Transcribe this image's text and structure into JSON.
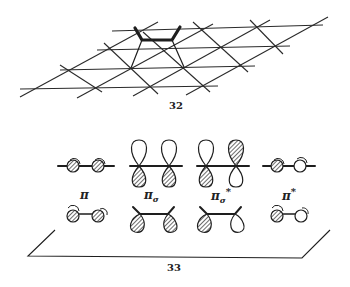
{
  "figures": [
    {
      "number": "32",
      "description": "Ethylene-like molecule adsorbed on a surface lattice (grid) with bonds to two surface atoms"
    },
    {
      "number": "33",
      "description": "Frontier orbitals of ethylene above and interacting with a surface plane",
      "orbitals": [
        {
          "symbol": "π",
          "subscript": "",
          "superscript": "",
          "name": "pi"
        },
        {
          "symbol": "π",
          "subscript": "σ",
          "superscript": "",
          "name": "pi-sigma"
        },
        {
          "symbol": "π",
          "subscript": "σ",
          "superscript": "*",
          "name": "pi-sigma-star"
        },
        {
          "symbol": "π",
          "subscript": "",
          "superscript": "*",
          "name": "pi-star"
        }
      ]
    }
  ],
  "colors": {
    "ink": "#1e1e1e",
    "background": "#ffffff"
  }
}
